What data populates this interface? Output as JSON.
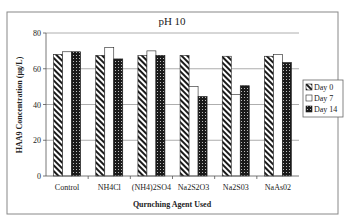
{
  "chart_data": {
    "type": "bar",
    "title": "pH 10",
    "xlabel": "Qurnching Agent Used",
    "ylabel": "HAA9 Concentration (µg/L)",
    "ylim": [
      0,
      80
    ],
    "yticks": [
      0,
      20,
      40,
      60,
      80
    ],
    "grid": true,
    "legend_position": "right",
    "categories": [
      "Control",
      "NH4Cl",
      "(NH4)2SO4",
      "Na2S2O3",
      "Na2S03",
      "NaAs02"
    ],
    "series": [
      {
        "name": "Day 0",
        "pattern": "diagonal-hatch",
        "values": [
          68,
          67.5,
          67.5,
          67.5,
          67,
          67
        ]
      },
      {
        "name": "Day 7",
        "pattern": "white",
        "values": [
          69.5,
          72,
          70,
          50,
          45.5,
          68
        ]
      },
      {
        "name": "Day 14",
        "pattern": "dark-dotted",
        "values": [
          69.5,
          65.5,
          67.5,
          44.5,
          50.5,
          63.5
        ]
      }
    ]
  },
  "colors": {
    "frame": "#888888",
    "gridline": "#999999",
    "axis": "#555555",
    "bar_outline": "#222222",
    "dark_fill": "#1a1a1a"
  }
}
